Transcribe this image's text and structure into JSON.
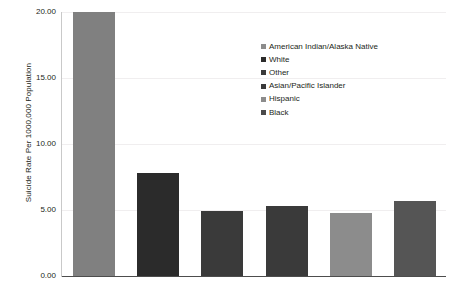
{
  "chart_data": {
    "type": "bar",
    "title": "",
    "xlabel": "",
    "ylabel": "Suicide Rate Per 1000,000 Population",
    "categories": [
      "American Indian/Alaska Native",
      "White",
      "Other",
      "Asian/Pacific Islander",
      "Hispanic",
      "Black"
    ],
    "values": [
      20.0,
      7.8,
      4.9,
      5.3,
      4.8,
      5.7
    ],
    "colors": [
      "#808080",
      "#2b2b2b",
      "#3a3a3a",
      "#3a3a3a",
      "#8c8c8c",
      "#555555"
    ],
    "ylim": [
      0.0,
      20.0
    ],
    "ytick_labels": [
      "0.00",
      "5.00",
      "10.00",
      "15.00",
      "20.00"
    ],
    "ytick_values": [
      0,
      5,
      10,
      15,
      20
    ],
    "grid": true,
    "legend_position": "center"
  },
  "legend": {
    "items": [
      {
        "label": "American Indian/Alaska Native",
        "color": "#8c8c8c"
      },
      {
        "label": "White",
        "color": "#2b2b2b"
      },
      {
        "label": "Other",
        "color": "#3a3a3a"
      },
      {
        "label": "Asian/Pacific Islander",
        "color": "#3a3a3a"
      },
      {
        "label": "Hispanic",
        "color": "#8c8c8c"
      },
      {
        "label": "Black",
        "color": "#4a4a4a"
      }
    ]
  }
}
